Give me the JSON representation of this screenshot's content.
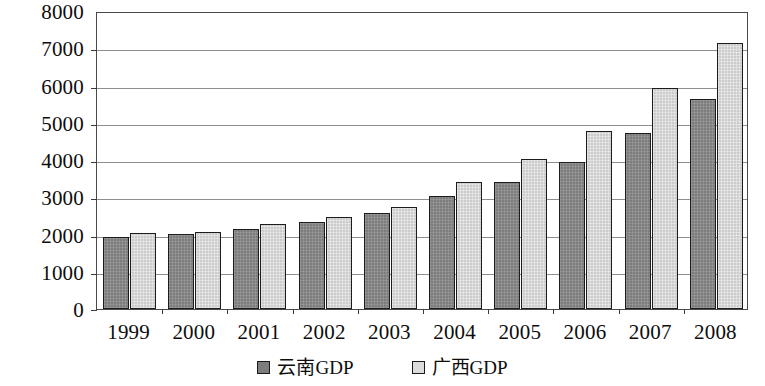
{
  "chart_data": {
    "type": "bar",
    "title": "",
    "subtitle": "",
    "xlabel": "",
    "ylabel": "",
    "categories": [
      "1999",
      "2000",
      "2001",
      "2002",
      "2003",
      "2004",
      "2005",
      "2006",
      "2007",
      "2008"
    ],
    "series": [
      {
        "name": "云南GDP",
        "color": "#7d7d7d",
        "values": [
          1930,
          2020,
          2150,
          2340,
          2580,
          3030,
          3420,
          3960,
          4720,
          5650
        ]
      },
      {
        "name": "广西GDP",
        "color": "#cccccc",
        "values": [
          2030,
          2070,
          2270,
          2480,
          2750,
          3410,
          4030,
          4790,
          5930,
          7150
        ]
      }
    ],
    "ylim": [
      0,
      8000
    ],
    "y_ticks": [
      0,
      1000,
      2000,
      3000,
      4000,
      5000,
      6000,
      7000,
      8000
    ],
    "y_tick_labels": [
      "0",
      "1000",
      "2000",
      "3000",
      "4000",
      "5000",
      "6000",
      "7000",
      "8000"
    ],
    "grid": true,
    "grid_axis": "y",
    "legend_position": "bottom",
    "legend_entries": [
      "云南GDP",
      "广西GDP"
    ]
  }
}
